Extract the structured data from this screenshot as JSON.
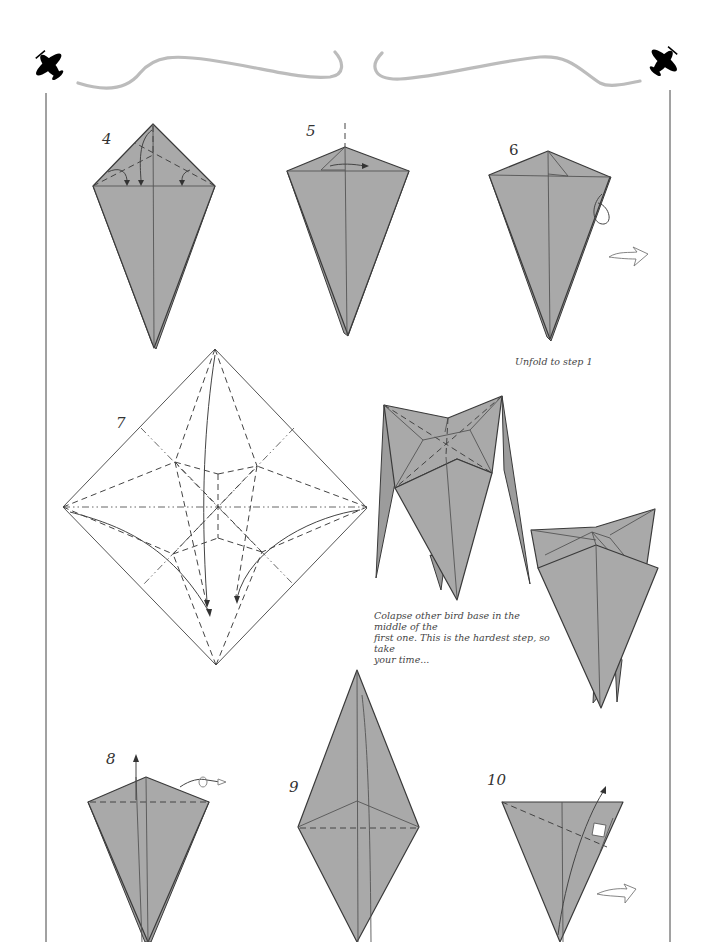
{
  "page": {
    "background": "#ffffff",
    "paper_color": "#a9a9a9",
    "line_color": "#3a3a3a",
    "swoosh_color": "#bcbcbc"
  },
  "header": {
    "left_icon": "airplane-icon",
    "right_icon": "airplane-icon"
  },
  "steps": [
    {
      "number": "4",
      "description": "Valley fold top flaps to centre crease, then unfold"
    },
    {
      "number": "5",
      "description": "Fold flap over to the right"
    },
    {
      "number": "6",
      "description": "Repeat behind"
    },
    {
      "number": "7",
      "description": "Crease pattern"
    },
    {
      "number": "8",
      "description": "Fold flap up; repeat behind"
    },
    {
      "number": "9",
      "description": "Kite shape with horizontal valley fold"
    },
    {
      "number": "10",
      "description": "Valley fold flap up; repeat behind"
    }
  ],
  "captions": {
    "step6": "Unfold to step 1",
    "collapse": "Colapse other bird base in the middle of the first one. This is the hardest step, so take your time..."
  },
  "caption_lines": {
    "collapse": [
      "Colapse other bird base in the middle of the",
      "first one. This is the hardest step, so take",
      "your time..."
    ]
  }
}
